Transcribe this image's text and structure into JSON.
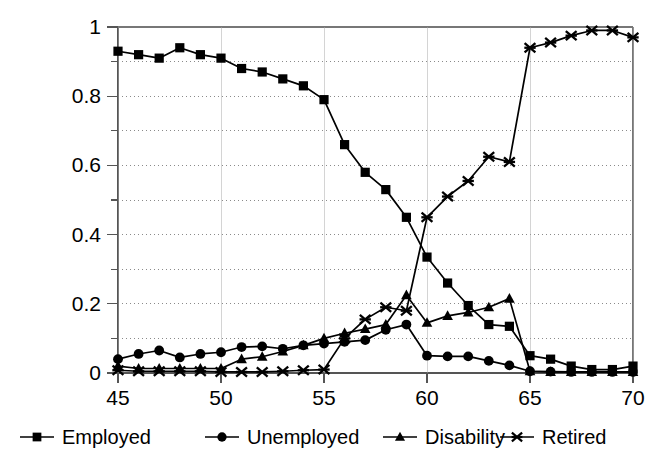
{
  "chart_data": {
    "type": "line",
    "title": "",
    "subtitle": "",
    "xlabel": "",
    "ylabel": "",
    "xlim": [
      45,
      70
    ],
    "ylim": [
      0,
      1
    ],
    "x_ticks": [
      45,
      50,
      55,
      60,
      65,
      70
    ],
    "y_ticks": [
      0,
      0.2,
      0.4,
      0.6,
      0.8,
      1
    ],
    "y_tick_labels": [
      "0",
      "0.2",
      "0.4",
      "0.6",
      "0.8",
      "1"
    ],
    "x_tick_labels": [
      "45",
      "50",
      "55",
      "60",
      "65",
      "70"
    ],
    "x_minor_step": 1,
    "y_minor_step": 0.1,
    "grid": "horizontal-dotted-minor",
    "legend_position": "bottom",
    "x": [
      45,
      46,
      47,
      48,
      49,
      50,
      51,
      52,
      53,
      54,
      55,
      56,
      57,
      58,
      59,
      60,
      61,
      62,
      63,
      64,
      65,
      66,
      67,
      68,
      69,
      70
    ],
    "series": [
      {
        "name": "Employed",
        "marker": "square",
        "color": "#000000",
        "values": [
          0.93,
          0.92,
          0.91,
          0.94,
          0.92,
          0.91,
          0.88,
          0.87,
          0.85,
          0.83,
          0.79,
          0.66,
          0.58,
          0.53,
          0.45,
          0.335,
          0.26,
          0.195,
          0.14,
          0.135,
          0.05,
          0.04,
          0.02,
          0.01,
          0.01,
          0.02
        ]
      },
      {
        "name": "Unemployed",
        "marker": "circle",
        "color": "#000000",
        "values": [
          0.04,
          0.055,
          0.065,
          0.045,
          0.055,
          0.06,
          0.075,
          0.077,
          0.07,
          0.08,
          0.085,
          0.09,
          0.095,
          0.125,
          0.14,
          0.05,
          0.048,
          0.048,
          0.035,
          0.022,
          0.005,
          0.004,
          0.003,
          0.003,
          0.003,
          0.003
        ]
      },
      {
        "name": "Disability",
        "marker": "triangle",
        "color": "#000000",
        "values": [
          0.02,
          0.013,
          0.013,
          0.013,
          0.013,
          0.013,
          0.04,
          0.047,
          0.062,
          0.08,
          0.1,
          0.115,
          0.127,
          0.14,
          0.225,
          0.145,
          0.165,
          0.175,
          0.19,
          0.215,
          0.005,
          0.003,
          0.003,
          0.003,
          0.003,
          0.003
        ]
      },
      {
        "name": "Retired",
        "marker": "cross-star",
        "color": "#000000",
        "values": [
          0.008,
          0.005,
          0.005,
          0.005,
          0.005,
          0.003,
          0.003,
          0.003,
          0.005,
          0.008,
          0.01,
          0.1,
          0.155,
          0.19,
          0.18,
          0.45,
          0.51,
          0.555,
          0.625,
          0.61,
          0.94,
          0.955,
          0.975,
          0.99,
          0.99,
          0.97
        ]
      }
    ]
  },
  "legend": {
    "items": [
      {
        "label": "Employed",
        "marker": "square"
      },
      {
        "label": "Unemployed",
        "marker": "circle"
      },
      {
        "label": "Disability",
        "marker": "triangle"
      },
      {
        "label": "Retired",
        "marker": "cross-star"
      }
    ]
  }
}
